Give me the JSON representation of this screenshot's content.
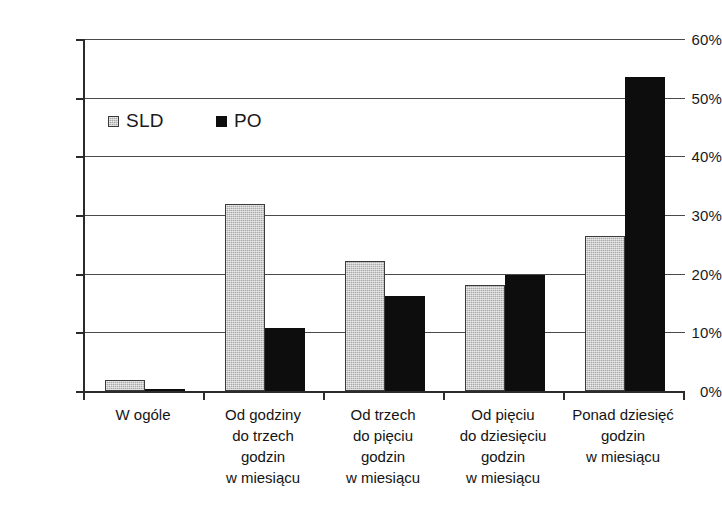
{
  "chart_data": {
    "type": "bar",
    "title": "",
    "subtitle": "",
    "xlabel": "",
    "ylabel": "",
    "ylim": [
      0,
      60
    ],
    "ytick_labels": [
      "0%",
      "10%",
      "20%",
      "30%",
      "40%",
      "50%",
      "60%"
    ],
    "ytick_values": [
      0,
      10,
      20,
      30,
      40,
      50,
      60
    ],
    "grid": true,
    "legend_position": "upper-left-inside",
    "categories": [
      "W ogóle",
      "Od godziny\ndo trzech\ngodzin\nw miesiącu",
      "Od trzech\ndo pięciu\ngodzin\nw miesiącu",
      "Od pięciu\ndo dziesięciu\ngodzin\nw miesiącu",
      "Ponad dziesięć\ngodzin\nw miesiącu"
    ],
    "series": [
      {
        "name": "SLD",
        "color": "#a9a9a9",
        "values": [
          1.8,
          31.8,
          22.1,
          18.0,
          26.4
        ]
      },
      {
        "name": "PO",
        "color": "#0d0d0d",
        "values": [
          0.2,
          10.7,
          16.2,
          19.7,
          53.6
        ]
      }
    ]
  },
  "legend": {
    "entries": [
      {
        "label": "SLD",
        "swatch": "gray-pattern-swatch"
      },
      {
        "label": "PO",
        "swatch": "black-swatch"
      }
    ]
  }
}
